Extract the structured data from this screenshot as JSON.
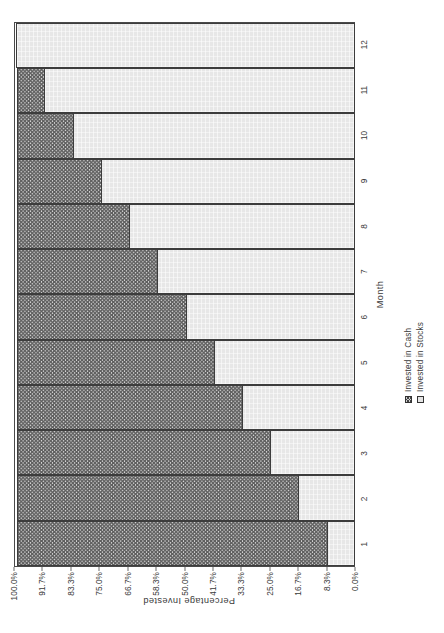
{
  "chart_data": {
    "type": "bar",
    "subtype": "stacked-bar-100-percent",
    "orientation": "vertical-bars-rotated-90ccw",
    "title": "",
    "xlabel": "Month",
    "ylabel": "Percentage Invested",
    "categories": [
      "1",
      "2",
      "3",
      "4",
      "5",
      "6",
      "7",
      "8",
      "9",
      "10",
      "11",
      "12"
    ],
    "ylim": [
      0,
      100
    ],
    "ytick_labels": [
      "0.0%",
      "8.3%",
      "16.7%",
      "25.0%",
      "33.3%",
      "41.7%",
      "50.0%",
      "58.3%",
      "66.7%",
      "75.0%",
      "83.3%",
      "91.7%",
      "100.0%"
    ],
    "ytick_values": [
      0,
      8.3,
      16.7,
      25.0,
      33.3,
      41.7,
      50.0,
      58.3,
      66.7,
      75.0,
      83.3,
      91.7,
      100.0
    ],
    "grid": false,
    "legend_position": "bottom-center",
    "series": [
      {
        "name": "Invested in Cash",
        "fill": "checkered-hatch",
        "color": "#d6d6d6",
        "values": [
          91.7,
          83.3,
          75.0,
          66.7,
          58.3,
          50.0,
          41.7,
          33.3,
          25.0,
          16.7,
          8.3,
          0.0
        ]
      },
      {
        "name": "Invested in Stocks",
        "fill": "solid-light",
        "color": "#e7e7e7",
        "values": [
          8.3,
          16.7,
          25.0,
          33.3,
          41.7,
          50.0,
          58.3,
          66.7,
          75.0,
          83.3,
          91.7,
          100.0
        ]
      }
    ]
  },
  "axes": {
    "y_title": "Percentage Invested",
    "x_title": "Month"
  },
  "legend": {
    "entries": [
      {
        "label": "Invested in Cash",
        "swatch": "cash"
      },
      {
        "label": "Invested in Stocks",
        "swatch": "stocks"
      }
    ]
  }
}
